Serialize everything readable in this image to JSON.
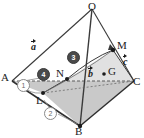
{
  "figure": {
    "kind": "solid-geometry-diagram",
    "background": "#ffffff",
    "stroke_color": "#3a3a3a",
    "base_fill": "#c9c9c9",
    "dash_color": "#6d6d6d",
    "marker_dark": "#4a4a4a",
    "marker_light_border": "#8a8a8a"
  },
  "vertices": [
    {
      "id": "O",
      "label": "O",
      "x": 92,
      "y": 8,
      "lx": 88,
      "ly": 2,
      "dot": false
    },
    {
      "id": "A",
      "label": "A",
      "x": 12,
      "y": 81,
      "lx": 2,
      "ly": 73,
      "dot": false
    },
    {
      "id": "B",
      "label": "B",
      "x": 80,
      "y": 126,
      "lx": 76,
      "ly": 126,
      "dot": true
    },
    {
      "id": "C",
      "label": "C",
      "x": 134,
      "y": 81,
      "lx": 133,
      "ly": 75,
      "dot": false
    },
    {
      "id": "M",
      "label": "M",
      "x": 113,
      "y": 50,
      "lx": 117,
      "ly": 42,
      "dot": true
    },
    {
      "id": "N",
      "label": "N",
      "x": 67,
      "y": 79,
      "lx": 58,
      "ly": 69,
      "dot": true
    },
    {
      "id": "L",
      "label": "L",
      "x": 43,
      "y": 93,
      "lx": 38,
      "ly": 96,
      "dot": true
    },
    {
      "id": "G",
      "label": "G",
      "x": 105,
      "y": 74,
      "lx": 108,
      "ly": 66,
      "dot": true
    }
  ],
  "vectors": [
    {
      "id": "a",
      "label": "a",
      "lx": 32,
      "ly": 42,
      "from": "A",
      "to": "O"
    },
    {
      "id": "b",
      "label": "b",
      "lx": 89,
      "ly": 70,
      "from": "A",
      "to": "B"
    },
    {
      "id": "c",
      "label": "c",
      "lx": 124,
      "ly": 58,
      "from": "A",
      "to": "C"
    }
  ],
  "step_markers": [
    {
      "id": "m1",
      "label": "①",
      "text": "1",
      "style": "light",
      "x": 22,
      "y": 84
    },
    {
      "id": "m2",
      "label": "②",
      "text": "2",
      "style": "light",
      "x": 49,
      "y": 112
    },
    {
      "id": "m3",
      "label": "③",
      "text": "3",
      "style": "dark",
      "x": 72,
      "y": 56
    },
    {
      "id": "m4",
      "label": "●",
      "text": "4",
      "style": "dark",
      "x": 42,
      "y": 73
    }
  ],
  "edges": [
    {
      "from": "O",
      "to": "A",
      "style": "solid"
    },
    {
      "from": "O",
      "to": "B",
      "style": "solid"
    },
    {
      "from": "O",
      "to": "C",
      "style": "solid"
    },
    {
      "from": "A",
      "to": "B",
      "style": "solid"
    },
    {
      "from": "B",
      "to": "C",
      "style": "solid"
    },
    {
      "from": "A",
      "to": "C",
      "style": "dashed"
    },
    {
      "from": "L",
      "to": "C",
      "style": "solid"
    },
    {
      "from": "L",
      "to": "N",
      "style": "solid"
    },
    {
      "from": "N",
      "to": "M",
      "style": "curve"
    },
    {
      "from": "L",
      "to": "M",
      "style": "curve"
    }
  ]
}
